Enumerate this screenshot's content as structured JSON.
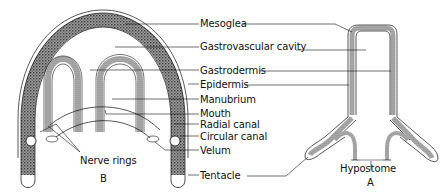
{
  "diagram": {
    "labels": {
      "mesoglea": "Mesoglea",
      "gastrovascular_cavity": "Gastrovascular cavity",
      "gastrodermis": "Gastrodermis",
      "epidermis": "Epidermis",
      "manubrium": "Manubrium",
      "mouth": "Mouth",
      "radial_canal": "Radial canal",
      "circular_canal": "Circular canal",
      "velum": "Velum",
      "tentacle": "Tentacle",
      "nerve_rings": "Nerve rings",
      "hypostome": "Hypostome"
    },
    "panels": {
      "medusa": "B",
      "polyp": "A"
    },
    "colors": {
      "ink": "#111111",
      "stipple": "#555555",
      "background": "#ffffff"
    }
  }
}
